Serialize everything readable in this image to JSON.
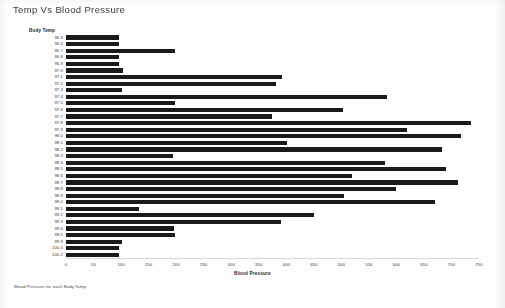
{
  "page": {
    "title": "Temp Vs Blood Pressure",
    "footer_note": "Blood Pressure  for each Body Temp",
    "background_color": "#fdfdfd",
    "bar_color": "#1a1a1a"
  },
  "chart_data": {
    "type": "bar",
    "orientation": "horizontal",
    "title": "Temp Vs Blood Pressure",
    "xlabel": "Blood Pressure",
    "ylabel": "Body Temp",
    "xlim": [
      0,
      750
    ],
    "xticks": [
      0,
      50,
      100,
      150,
      200,
      250,
      300,
      350,
      400,
      450,
      500,
      550,
      600,
      650,
      700,
      750
    ],
    "xtick_labels": [
      "0",
      "50",
      "100",
      "150",
      "200",
      "250",
      "300",
      "350",
      "400",
      "450",
      "500",
      "550",
      "600",
      "650",
      "700",
      "750"
    ],
    "grid": false,
    "legend": false,
    "categories": [
      "96.3",
      "96.4",
      "96.7",
      "96.8",
      "96.9",
      "97.0",
      "97.1",
      "97.2",
      "97.3",
      "97.4",
      "97.5",
      "97.6",
      "97.7",
      "97.8",
      "97.9",
      "98.0",
      "98.1",
      "98.2",
      "98.3",
      "98.4",
      "98.5",
      "98.6",
      "98.7",
      "98.8",
      "98.9",
      "99.0",
      "99.1",
      "99.2",
      "99.3",
      "99.4",
      "99.5",
      "99.9",
      "100.0",
      "100.2"
    ],
    "values": [
      97,
      97,
      198,
      97,
      97,
      103,
      393,
      382,
      101,
      583,
      198,
      503,
      374,
      735,
      620,
      717,
      402,
      683,
      195,
      580,
      690,
      520,
      712,
      600,
      504,
      670,
      132,
      450,
      390,
      197,
      198,
      102,
      97,
      97
    ]
  }
}
